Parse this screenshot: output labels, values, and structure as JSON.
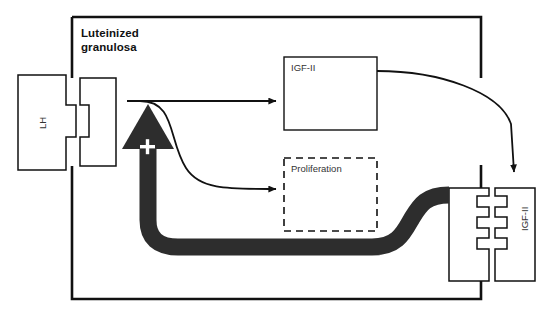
{
  "diagram": {
    "type": "signalling-pathway",
    "cell": {
      "name": "luteinized-granulosa-cell",
      "title": "Luteinized\ngranulosa",
      "title_line1": "Luteinized",
      "title_line2": "granulosa"
    },
    "nodes": [
      {
        "id": "lh-ligand",
        "label": "LH",
        "shape": "ligand",
        "orientation": "vertical",
        "position": "outside-left"
      },
      {
        "id": "lh-receptor",
        "label": "",
        "shape": "receptor",
        "notches": 1,
        "position": "membrane-left"
      },
      {
        "id": "igf2-product",
        "label": "IGF-II",
        "shape": "box",
        "border": "solid",
        "position": "intracellular-top"
      },
      {
        "id": "proliferation",
        "label": "Proliferation",
        "shape": "box",
        "border": "dashed",
        "position": "intracellular-middle"
      },
      {
        "id": "igf2-receptor",
        "label": "",
        "shape": "receptor",
        "notches": 3,
        "position": "membrane-right"
      },
      {
        "id": "igf2-ligand",
        "label": "IGF-II",
        "shape": "ligand",
        "orientation": "vertical",
        "position": "outside-right"
      }
    ],
    "edges": [
      {
        "id": "lh-to-igf2",
        "from": "lh-receptor",
        "to": "igf2-product",
        "style": "thin-arrow",
        "sign": ""
      },
      {
        "id": "lh-to-prolif",
        "from": "lh-receptor",
        "to": "proliferation",
        "style": "thin-curve-arrow",
        "sign": ""
      },
      {
        "id": "igf2-secretion",
        "from": "igf2-product",
        "to": "igf2-ligand",
        "style": "thin-curve-arrow",
        "sign": ""
      },
      {
        "id": "igf2-feedback",
        "from": "igf2-receptor",
        "to": "lh-receptor",
        "style": "thick-band-arrow",
        "sign": "+"
      }
    ],
    "annotations": [
      {
        "id": "positive-feedback-sign",
        "text": "+",
        "on": "igf2-feedback"
      }
    ]
  },
  "colors": {
    "stroke": "#111111",
    "thick_band": "#2d2d2d",
    "text": "#1a1a1a",
    "muted_text": "#333333",
    "background": "#ffffff"
  }
}
